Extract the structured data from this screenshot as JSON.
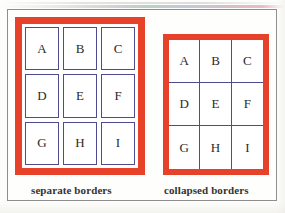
{
  "figure": {
    "type": "css-border-model-illustration",
    "background_color": "#fdfdfb",
    "frame_color": "#8e8e8e"
  },
  "colors": {
    "table_border_red": "#e8412a",
    "cell_border_blue": "#4c4c8e",
    "cell_background": "#ffffff",
    "letter_color": "#2a2a2a",
    "caption_color": "#333333"
  },
  "tables": [
    {
      "id": "separate",
      "caption": "separate borders",
      "border_model": "separate",
      "rows": [
        [
          "A",
          "B",
          "C"
        ],
        [
          "D",
          "E",
          "F"
        ],
        [
          "G",
          "H",
          "I"
        ]
      ]
    },
    {
      "id": "collapsed",
      "caption": "collapsed borders",
      "border_model": "collapse",
      "rows": [
        [
          "A",
          "B",
          "C"
        ],
        [
          "D",
          "E",
          "F"
        ],
        [
          "G",
          "H",
          "I"
        ]
      ]
    }
  ]
}
